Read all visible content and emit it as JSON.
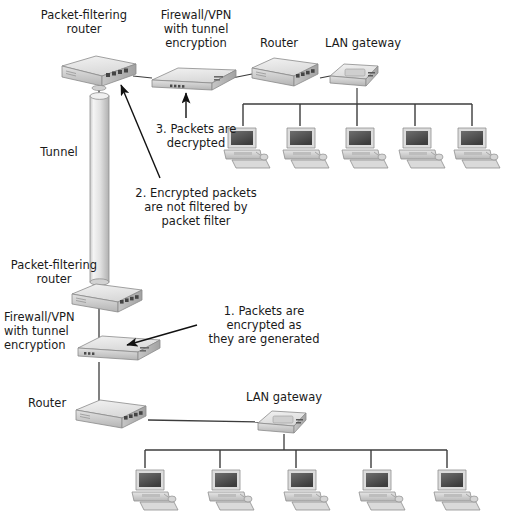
{
  "diagram": {
    "background_color": "#ffffff",
    "text_color": "#1a1a1a",
    "line_color": "#3c3c3c",
    "device_fill": "#d8d8d8",
    "device_top": "#ececec",
    "device_shadow": "#9a9a9a"
  },
  "labels": {
    "top_packet_filtering_router": "Packet-filtering\nrouter",
    "firewall_vpn_top": "Firewall/VPN\nwith tunnel\nencryption",
    "router_top": "Router",
    "lan_gateway_top": "LAN gateway",
    "tunnel": "Tunnel",
    "bottom_packet_filtering_router": "Packet-filtering\nrouter",
    "firewall_vpn_bottom": "Firewall/VPN\nwith tunnel\nencryption",
    "router_bottom": "Router",
    "lan_gateway_bottom": "LAN gateway"
  },
  "annotations": {
    "step1": "1. Packets are\nencrypted as\nthey are generated",
    "step2": "2. Encrypted packets\nare not filtered by\npacket filter",
    "step3": "3. Packets are\ndecrypted"
  },
  "nodes": {
    "top_router_pf": {
      "name": "packet-filtering-router-top",
      "x": 60,
      "y": 58
    },
    "top_firewall": {
      "name": "firewall-vpn-top",
      "x": 148,
      "y": 66
    },
    "top_router": {
      "name": "router-top",
      "x": 250,
      "y": 58
    },
    "top_gateway": {
      "name": "lan-gateway-top",
      "x": 322,
      "y": 62
    },
    "bottom_router_pf": {
      "name": "packet-filtering-router-bottom",
      "x": 72,
      "y": 286
    },
    "bottom_firewall": {
      "name": "firewall-vpn-bottom",
      "x": 78,
      "y": 336
    },
    "bottom_router": {
      "name": "router-bottom",
      "x": 76,
      "y": 402
    },
    "bottom_gateway": {
      "name": "lan-gateway-bottom",
      "x": 252,
      "y": 410
    },
    "tunnel": {
      "name": "vpn-tunnel",
      "x": 90,
      "y": 90,
      "width": 18,
      "height": 190
    }
  },
  "workstations": {
    "top_row_count": 5,
    "bottom_row_count": 5,
    "top_row_x": [
      222,
      281,
      340,
      399,
      447
    ],
    "top_row_y": 125,
    "bottom_row_x": [
      133,
      193,
      253,
      313,
      373
    ],
    "bottom_row_y": 465,
    "top_bus_y": 104,
    "top_bus_x1": 243,
    "top_bus_x2": 472,
    "bottom_bus_y": 450,
    "bottom_bus_x1": 145,
    "bottom_bus_x2": 447
  }
}
